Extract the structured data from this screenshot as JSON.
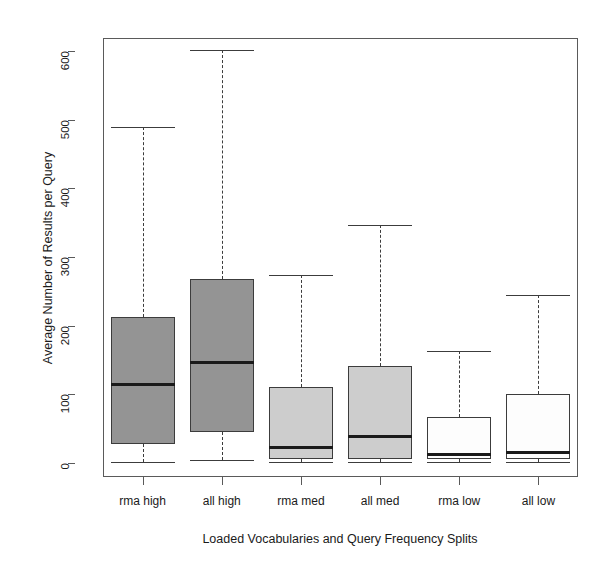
{
  "chart_data": {
    "type": "box",
    "title": "",
    "xlabel": "Loaded Vocabularies and Query Frequency Splits",
    "ylabel": "Average Number of Results per Query",
    "ylim": [
      0,
      630
    ],
    "yticks": [
      0,
      100,
      200,
      300,
      400,
      500,
      600
    ],
    "ytick_labels": [
      "0",
      "100",
      "200",
      "300",
      "400",
      "500",
      "600"
    ],
    "grid": false,
    "legend": "none",
    "categories": [
      "rma high",
      "all high",
      "rma med",
      "all med",
      "rma low",
      "all low"
    ],
    "boxes": [
      {
        "label": "rma high",
        "whisker_low": 2,
        "q1": 28,
        "median": 115,
        "q3": 213,
        "whisker_high": 490,
        "fill": "#949494"
      },
      {
        "label": "all high",
        "whisker_low": 4,
        "q1": 45,
        "median": 146,
        "q3": 268,
        "whisker_high": 601,
        "fill": "#949494"
      },
      {
        "label": "rma med",
        "whisker_low": 1,
        "q1": 6,
        "median": 23,
        "q3": 111,
        "whisker_high": 274,
        "fill": "#cdcdcd"
      },
      {
        "label": "all med",
        "whisker_low": 1,
        "q1": 6,
        "median": 38,
        "q3": 141,
        "whisker_high": 346,
        "fill": "#cdcdcd"
      },
      {
        "label": "rma low",
        "whisker_low": 1,
        "q1": 6,
        "median": 12,
        "q3": 67,
        "whisker_high": 163,
        "fill": "#fdfdfd"
      },
      {
        "label": "all low",
        "whisker_low": 1,
        "q1": 6,
        "median": 16,
        "q3": 100,
        "whisker_high": 245,
        "fill": "#fdfdfd"
      }
    ],
    "colors": {
      "axis": "#5a5a5a",
      "box_border": "#3c3c3c",
      "median": "#1a1a1a",
      "background": "#ffffff"
    }
  }
}
